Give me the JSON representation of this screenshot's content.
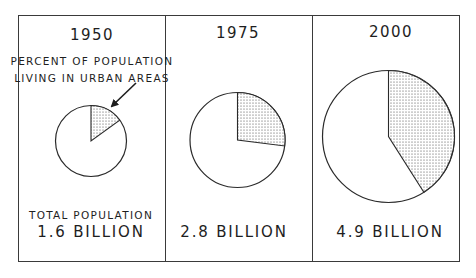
{
  "chart_data": {
    "type": "pie",
    "title": "",
    "legend": "Shaded slice = percent of population living in urban areas",
    "annotation": "PERCENT OF POPULATION LIVING IN URBAN AREAS",
    "panels": [
      {
        "year": "1950",
        "total_population_billion": 1.6,
        "total_label": "1.6 BILLION",
        "urban_percent": 15,
        "rural_percent": 85
      },
      {
        "year": "1975",
        "total_population_billion": 2.8,
        "total_label": "2.8 BILLION",
        "urban_percent": 27,
        "rural_percent": 73
      },
      {
        "year": "2000",
        "total_population_billion": 4.9,
        "total_label": "4.9 BILLION",
        "urban_percent": 41,
        "rural_percent": 59
      }
    ],
    "layout_hints": {
      "pie_size_scaled_by_total_population": true,
      "slice_start": "12 o'clock, clockwise",
      "slice_fill": "stippled dots",
      "grid": false
    }
  },
  "panels": [
    {
      "year": "1950",
      "annotation_line1": "PERCENT OF POPULATION",
      "annotation_line2": "LIVING IN URBAN AREAS",
      "total_heading": "TOTAL POPULATION",
      "total_value": "1.6 BILLION"
    },
    {
      "year": "1975",
      "total_value": "2.8 BILLION"
    },
    {
      "year": "2000",
      "total_value": "4.9 BILLION"
    }
  ],
  "colors": {
    "ink": "#2a2a2a",
    "background": "#ffffff",
    "stipple": "#3c3c3c"
  }
}
